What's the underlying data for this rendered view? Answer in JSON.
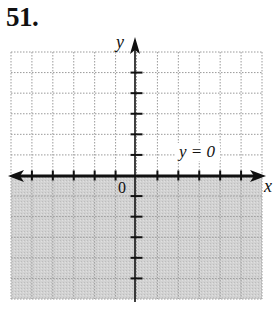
{
  "problem": {
    "number": "51."
  },
  "chart_data": {
    "type": "line",
    "title": "",
    "xlabel": "x",
    "ylabel": "y",
    "xlim": [
      -6,
      6
    ],
    "ylim": [
      -6,
      6
    ],
    "grid": true,
    "origin_label": "0",
    "series": [
      {
        "name": "y = 0",
        "equation": "y = 0",
        "style": "solid",
        "x": [
          -6,
          6
        ],
        "y": [
          0,
          0
        ]
      }
    ],
    "shaded_region": {
      "inequality": "y < 0",
      "description": "half-plane below the x-axis",
      "fill": "#cfcfcf"
    },
    "annotations": [
      {
        "text": "y = 0",
        "x": 3,
        "y": 0.9
      }
    ],
    "ticks": {
      "x": [
        -5,
        -4,
        -3,
        -2,
        -1,
        1,
        2,
        3,
        4,
        5
      ],
      "y": [
        -5,
        -4,
        -3,
        -2,
        -1,
        1,
        2,
        3,
        4,
        5
      ]
    }
  },
  "labels": {
    "x_axis": "x",
    "y_axis": "y",
    "origin": "0",
    "line_label": "y = 0"
  },
  "colors": {
    "axis": "#111111",
    "grid": "#9a9a9a",
    "shade": "#cfcfcf"
  }
}
